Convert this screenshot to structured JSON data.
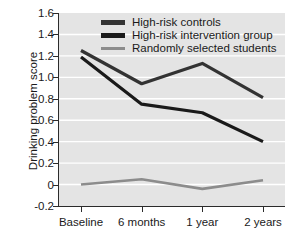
{
  "chart_data": {
    "type": "line",
    "title": "",
    "xlabel": "",
    "ylabel": "Drinking problem score",
    "categories": [
      "Baseline",
      "6 months",
      "1 year",
      "2 years"
    ],
    "ylim": [
      -0.2,
      1.6
    ],
    "yticks": [
      "1.6",
      "1.4",
      "1.2",
      "1.0",
      "0.8",
      "0.6",
      "0.4",
      "0.2",
      "0",
      "-0.2"
    ],
    "ytick_values": [
      1.6,
      1.4,
      1.2,
      1.0,
      0.8,
      0.6,
      0.4,
      0.2,
      0,
      -0.2
    ],
    "grid": "horizontal-white",
    "legend_position": "top-center",
    "series": [
      {
        "name": "High-risk controls",
        "color": "#333333",
        "values": [
          1.25,
          0.94,
          1.13,
          0.81
        ]
      },
      {
        "name": "High-risk intervention group",
        "color": "#1a1a1a",
        "values": [
          1.19,
          0.75,
          0.67,
          0.4
        ]
      },
      {
        "name": "Randomly selected students",
        "color": "#8c8c8c",
        "values": [
          0.0,
          0.05,
          -0.04,
          0.04
        ]
      }
    ]
  },
  "colors": {
    "plot_background": "#e4e4e4",
    "gridline": "#ffffff",
    "axis": "#2b2b2b",
    "text": "#1a1a1a"
  }
}
